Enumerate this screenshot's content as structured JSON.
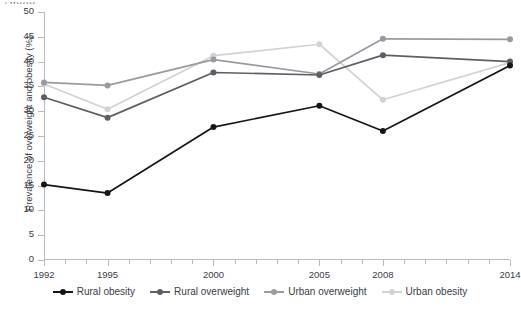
{
  "page": {
    "title_fragment": "ˌ  ̦   ̦  ̖   ̗     ̗  ̖      ̖ ̗",
    "background": "#ffffff"
  },
  "chart_data": {
    "type": "line",
    "title": "",
    "xlabel": "",
    "ylabel": "Prevalence of overweight and obesity (%)",
    "x": [
      1992,
      1995,
      2000,
      2005,
      2008,
      2014
    ],
    "xlim": [
      1992,
      2014
    ],
    "ylim": [
      0,
      50
    ],
    "yticks": [
      0,
      5,
      10,
      15,
      20,
      25,
      30,
      35,
      40,
      45,
      50
    ],
    "xticks_labeled": [
      1992,
      1995,
      2000,
      2005,
      2008,
      2014
    ],
    "xticks_minor_step": 1,
    "grid": false,
    "legend_position": "bottom",
    "series": [
      {
        "name": "Rural obesity",
        "color": "#161616",
        "values": [
          15.2,
          13.5,
          26.8,
          31.1,
          26.0,
          39.2
        ]
      },
      {
        "name": "Rural overweight",
        "color": "#5e5e66",
        "values": [
          32.8,
          28.7,
          37.8,
          37.3,
          41.3,
          40.0
        ]
      },
      {
        "name": "Urban overweight",
        "color": "#9a9aa2",
        "values": [
          35.8,
          35.2,
          40.4,
          37.5,
          44.6,
          44.5
        ]
      },
      {
        "name": "Urban obesity",
        "color": "#d2d2d6",
        "values": [
          35.5,
          30.4,
          41.2,
          43.5,
          32.3,
          39.8
        ]
      }
    ]
  },
  "axis": {
    "tick_color": "#b9b9c2",
    "text_color": "#3b3b46"
  }
}
